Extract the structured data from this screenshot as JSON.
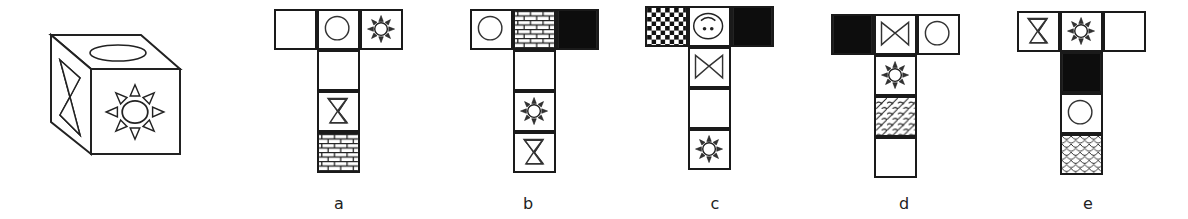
{
  "figure": {
    "type": "cube-net-puzzle",
    "cube": {
      "visible_faces": {
        "top": "ellipse",
        "front": "sun",
        "left": "hourglass"
      }
    },
    "options": [
      {
        "label": "a",
        "cells": [
          {
            "row": 0,
            "col": 0,
            "face": "blank"
          },
          {
            "row": 0,
            "col": 1,
            "face": "circle"
          },
          {
            "row": 0,
            "col": 2,
            "face": "sun"
          },
          {
            "row": 1,
            "col": 1,
            "face": "blank"
          },
          {
            "row": 2,
            "col": 1,
            "face": "hourglass"
          },
          {
            "row": 3,
            "col": 1,
            "face": "brick"
          }
        ]
      },
      {
        "label": "b",
        "cells": [
          {
            "row": 0,
            "col": 0,
            "face": "circle"
          },
          {
            "row": 0,
            "col": 1,
            "face": "brick"
          },
          {
            "row": 0,
            "col": 2,
            "face": "black"
          },
          {
            "row": 1,
            "col": 1,
            "face": "blank"
          },
          {
            "row": 2,
            "col": 1,
            "face": "sun"
          },
          {
            "row": 3,
            "col": 1,
            "face": "hourglass"
          }
        ]
      },
      {
        "label": "c",
        "cells": [
          {
            "row": 0,
            "col": 0,
            "face": "checker"
          },
          {
            "row": 0,
            "col": 1,
            "face": "face-oval"
          },
          {
            "row": 0,
            "col": 2,
            "face": "black"
          },
          {
            "row": 1,
            "col": 1,
            "face": "bowtie"
          },
          {
            "row": 2,
            "col": 1,
            "face": "blank"
          },
          {
            "row": 3,
            "col": 1,
            "face": "sun"
          }
        ]
      },
      {
        "label": "d",
        "cells": [
          {
            "row": 0,
            "col": 0,
            "face": "black"
          },
          {
            "row": 0,
            "col": 1,
            "face": "bowtie"
          },
          {
            "row": 0,
            "col": 2,
            "face": "circle"
          },
          {
            "row": 1,
            "col": 1,
            "face": "sun"
          },
          {
            "row": 2,
            "col": 1,
            "face": "weave"
          },
          {
            "row": 3,
            "col": 1,
            "face": "blank"
          }
        ]
      },
      {
        "label": "e",
        "cells": [
          {
            "row": 0,
            "col": 0,
            "face": "hourglass"
          },
          {
            "row": 0,
            "col": 1,
            "face": "sun"
          },
          {
            "row": 0,
            "col": 2,
            "face": "blank"
          },
          {
            "row": 1,
            "col": 1,
            "face": "black"
          },
          {
            "row": 2,
            "col": 1,
            "face": "circle"
          },
          {
            "row": 3,
            "col": 1,
            "face": "scallop"
          }
        ]
      }
    ]
  },
  "labels": {
    "a": "a",
    "b": "b",
    "c": "c",
    "d": "d",
    "e": "e"
  }
}
